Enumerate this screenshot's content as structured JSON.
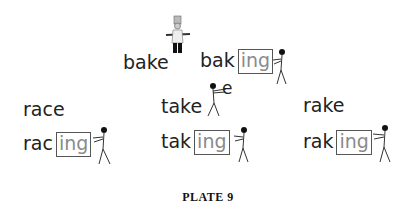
{
  "plate": {
    "title": "PLATE 9"
  },
  "groups": [
    {
      "base": "bake",
      "stem": "bak",
      "suffix": "ing",
      "illustration": "chef-carrying-tray"
    },
    {
      "base": "race",
      "stem": "rac",
      "suffix": "ing",
      "illustration": "stick-figure-pushing-box"
    },
    {
      "base": "take",
      "stem": "tak",
      "suffix": "ing",
      "removed_letter": "e",
      "illustration": "stick-figure-carrying-e"
    },
    {
      "base": "rake",
      "stem": "rak",
      "suffix": "ing",
      "illustration": "stick-figure-pushing-box"
    }
  ],
  "colors": {
    "text": "#222222",
    "suffix_text": "#8a8a8a",
    "box_border": "#555555",
    "background": "#ffffff"
  }
}
